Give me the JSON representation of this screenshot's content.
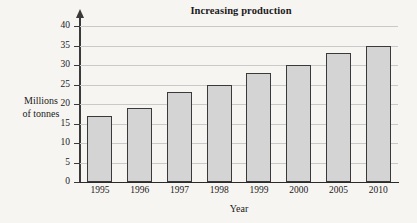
{
  "chart_data": {
    "type": "bar",
    "title": "Increasing production",
    "xlabel": "Year",
    "ylabel": "Millions of tonnes",
    "ylabel_lines": [
      "Millions",
      "of tonnes"
    ],
    "categories": [
      "1995",
      "1996",
      "1997",
      "1998",
      "1999",
      "2000",
      "2005",
      "2010"
    ],
    "values": [
      17,
      19,
      23,
      25,
      28,
      30,
      33,
      35
    ],
    "yticks": [
      0,
      5,
      10,
      15,
      20,
      25,
      30,
      35,
      40
    ],
    "ytick_labels": [
      "0",
      "5",
      "10",
      "15",
      "20",
      "25",
      "30",
      "35",
      "40"
    ],
    "ylim": [
      0,
      40
    ],
    "grid": true,
    "legend": false,
    "series": [
      {
        "name": "Production",
        "values": [
          17,
          19,
          23,
          25,
          28,
          30,
          33,
          35
        ]
      }
    ],
    "colors": {
      "bar_fill": "#d4d4d4",
      "bar_border": "#3a3a3a",
      "gridline": "#c9c9c9",
      "axis": "#2b2b2b",
      "background": "#f7f5f2",
      "text": "#1a1a1a"
    }
  }
}
